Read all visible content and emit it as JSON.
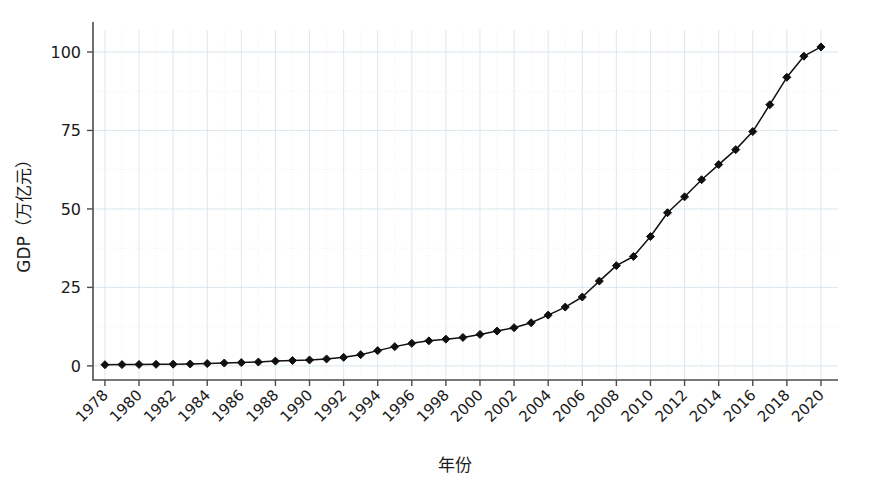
{
  "chart_data": {
    "type": "line",
    "title": "",
    "xlabel": "年份",
    "ylabel": "GDP（万亿元）",
    "xlim": [
      1977.3,
      2021.0
    ],
    "ylim": [
      -4.5,
      107.0
    ],
    "grid": true,
    "legend": null,
    "marker": "diamond",
    "line_color": "#111111",
    "grid_color": "#d8e4ec",
    "x_tick_labels": [
      "1978",
      "1980",
      "1982",
      "1984",
      "1986",
      "1988",
      "1990",
      "1992",
      "1994",
      "1996",
      "1998",
      "2000",
      "2002",
      "2004",
      "2006",
      "2008",
      "2010",
      "2012",
      "2014",
      "2016",
      "2018",
      "2020"
    ],
    "x_ticks": [
      1978,
      1980,
      1982,
      1984,
      1986,
      1988,
      1990,
      1992,
      1994,
      1996,
      1998,
      2000,
      2002,
      2004,
      2006,
      2008,
      2010,
      2012,
      2014,
      2016,
      2018,
      2020
    ],
    "y_tick_labels": [
      "0",
      "25",
      "50",
      "75",
      "100"
    ],
    "y_ticks": [
      0,
      25,
      50,
      75,
      100
    ],
    "x_tick_rotation": 45,
    "x": [
      1978,
      1979,
      1980,
      1981,
      1982,
      1983,
      1984,
      1985,
      1986,
      1987,
      1988,
      1989,
      1990,
      1991,
      1992,
      1993,
      1994,
      1995,
      1996,
      1997,
      1998,
      1999,
      2000,
      2001,
      2002,
      2003,
      2004,
      2005,
      2006,
      2007,
      2008,
      2009,
      2010,
      2011,
      2012,
      2013,
      2014,
      2015,
      2016,
      2017,
      2018,
      2019,
      2020
    ],
    "values": [
      0.37,
      0.41,
      0.46,
      0.49,
      0.54,
      0.6,
      0.72,
      0.91,
      1.04,
      1.22,
      1.52,
      1.72,
      1.89,
      2.2,
      2.72,
      3.57,
      4.86,
      6.13,
      7.18,
      7.97,
      8.52,
      9.06,
      10.03,
      11.09,
      12.17,
      13.74,
      16.18,
      18.73,
      21.94,
      27.01,
      31.92,
      34.85,
      41.21,
      48.79,
      53.86,
      59.3,
      64.13,
      68.89,
      74.64,
      83.2,
      91.93,
      98.65,
      101.6
    ],
    "data_points": [
      {
        "year": 1978,
        "gdp": 0.37
      },
      {
        "year": 1979,
        "gdp": 0.41
      },
      {
        "year": 1980,
        "gdp": 0.46
      },
      {
        "year": 1981,
        "gdp": 0.49
      },
      {
        "year": 1982,
        "gdp": 0.54
      },
      {
        "year": 1983,
        "gdp": 0.6
      },
      {
        "year": 1984,
        "gdp": 0.72
      },
      {
        "year": 1985,
        "gdp": 0.91
      },
      {
        "year": 1986,
        "gdp": 1.04
      },
      {
        "year": 1987,
        "gdp": 1.22
      },
      {
        "year": 1988,
        "gdp": 1.52
      },
      {
        "year": 1989,
        "gdp": 1.72
      },
      {
        "year": 1990,
        "gdp": 1.89
      },
      {
        "year": 1991,
        "gdp": 2.2
      },
      {
        "year": 1992,
        "gdp": 2.72
      },
      {
        "year": 1993,
        "gdp": 3.57
      },
      {
        "year": 1994,
        "gdp": 4.86
      },
      {
        "year": 1995,
        "gdp": 6.13
      },
      {
        "year": 1996,
        "gdp": 7.18
      },
      {
        "year": 1997,
        "gdp": 7.97
      },
      {
        "year": 1998,
        "gdp": 8.52
      },
      {
        "year": 1999,
        "gdp": 9.06
      },
      {
        "year": 2000,
        "gdp": 10.03
      },
      {
        "year": 2001,
        "gdp": 11.09
      },
      {
        "year": 2002,
        "gdp": 12.17
      },
      {
        "year": 2003,
        "gdp": 13.74
      },
      {
        "year": 2004,
        "gdp": 16.18
      },
      {
        "year": 2005,
        "gdp": 18.73
      },
      {
        "year": 2006,
        "gdp": 21.94
      },
      {
        "year": 2007,
        "gdp": 27.01
      },
      {
        "year": 2008,
        "gdp": 31.92
      },
      {
        "year": 2009,
        "gdp": 34.85
      },
      {
        "year": 2010,
        "gdp": 41.21
      },
      {
        "year": 2011,
        "gdp": 48.79
      },
      {
        "year": 2012,
        "gdp": 53.86
      },
      {
        "year": 2013,
        "gdp": 59.3
      },
      {
        "year": 2014,
        "gdp": 64.13
      },
      {
        "year": 2015,
        "gdp": 68.89
      },
      {
        "year": 2016,
        "gdp": 74.64
      },
      {
        "year": 2017,
        "gdp": 83.2
      },
      {
        "year": 2018,
        "gdp": 91.93
      },
      {
        "year": 2019,
        "gdp": 98.65
      },
      {
        "year": 2020,
        "gdp": 101.6
      }
    ]
  }
}
